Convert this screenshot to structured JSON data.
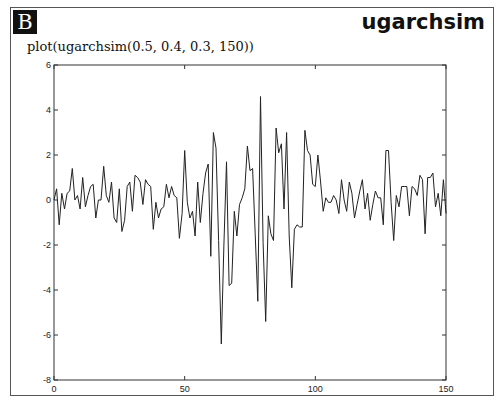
{
  "panel": {
    "badge": "B",
    "title": "ugarchsim",
    "command": "plot(ugarchsim(0.5, 0.4, 0.3, 150))"
  },
  "chart_data": {
    "type": "line",
    "title": "",
    "xlabel": "",
    "ylabel": "",
    "xlim": [
      0,
      150
    ],
    "ylim": [
      -8,
      6
    ],
    "xticks": [
      0,
      50,
      100,
      150
    ],
    "yticks": [
      -8,
      -6,
      -4,
      -2,
      0,
      2,
      4,
      6
    ],
    "grid": false,
    "legend": null,
    "line_color": "#222222",
    "series": [
      {
        "name": "ugarchsim(0.5, 0.4, 0.3, 150)",
        "x_start": 0,
        "values": [
          0.0,
          0.5,
          -1.1,
          0.3,
          -0.4,
          0.3,
          0.4,
          1.4,
          0.0,
          0.2,
          -0.4,
          1.0,
          -0.3,
          0.2,
          0.6,
          0.7,
          -0.8,
          0.0,
          0.0,
          1.5,
          0.2,
          -0.1,
          0.8,
          -0.8,
          -1.0,
          0.5,
          -1.4,
          -0.9,
          0.6,
          0.8,
          -0.5,
          1.1,
          1.0,
          0.8,
          -0.2,
          0.9,
          0.7,
          0.6,
          -1.3,
          -0.1,
          -0.8,
          -0.4,
          -0.3,
          0.7,
          0.1,
          0.6,
          0.2,
          0.1,
          -1.7,
          -0.6,
          2.2,
          -0.1,
          -0.8,
          -0.5,
          -1.6,
          0.8,
          -1.0,
          0.3,
          1.2,
          1.6,
          -2.5,
          3.0,
          2.3,
          -1.8,
          -6.4,
          -2.0,
          1.7,
          -3.8,
          -3.7,
          -0.5,
          -1.6,
          -0.2,
          0.1,
          0.5,
          2.4,
          1.3,
          1.4,
          -1.5,
          -4.5,
          4.6,
          -1.9,
          -5.4,
          -0.7,
          -1.5,
          -1.8,
          3.2,
          2.1,
          2.5,
          -0.4,
          3.0,
          -1.6,
          -3.9,
          -1.3,
          -1.1,
          -1.2,
          -1.2,
          3.1,
          2.2,
          2.0,
          0.7,
          0.6,
          2.0,
          0.8,
          -0.5,
          0.1,
          -0.1,
          -0.1,
          0.2,
          0.0,
          -0.6,
          0.9,
          0.0,
          -0.5,
          0.8,
          0.3,
          -0.8,
          -0.2,
          0.4,
          0.9,
          -0.4,
          0.3,
          -0.9,
          -0.2,
          0.4,
          0.1,
          0.1,
          -1.1,
          2.2,
          2.2,
          -0.1,
          -1.8,
          0.2,
          -0.3,
          0.6,
          0.6,
          0.6,
          -0.7,
          0.6,
          0.5,
          0.2,
          1.1,
          0.9,
          -1.5,
          1.0,
          1.0,
          1.2,
          -0.3,
          0.3,
          -0.7,
          0.9,
          -0.6
        ]
      }
    ]
  },
  "layout": {
    "plot_left": 54,
    "plot_right": 446,
    "plot_top": 65,
    "plot_bottom": 380
  }
}
